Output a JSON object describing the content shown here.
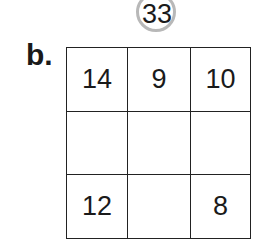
{
  "target": {
    "value": "33"
  },
  "problem_label": "b.",
  "grid": {
    "rows": [
      [
        "14",
        "9",
        "10"
      ],
      [
        "",
        "",
        ""
      ],
      [
        "12",
        "",
        "8"
      ]
    ]
  }
}
